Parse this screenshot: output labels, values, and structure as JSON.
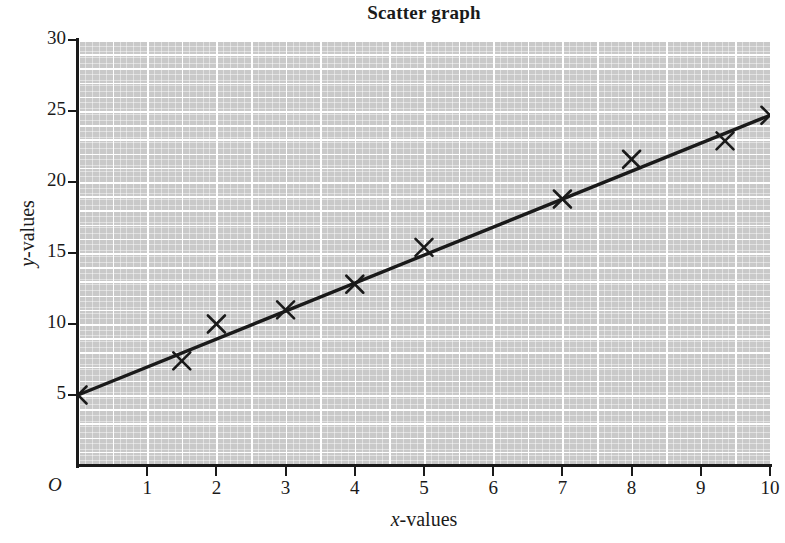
{
  "chart_data": {
    "type": "scatter",
    "title": "Scatter graph",
    "xlabel_symbol": "x",
    "xlabel_rest": "-values",
    "ylabel_symbol": "y",
    "ylabel_rest": "-values",
    "xlabel": "x-values",
    "ylabel": "y-values",
    "origin_label": "O",
    "xlim": [
      0,
      10
    ],
    "ylim": [
      0,
      30
    ],
    "x_ticks": [
      1,
      2,
      3,
      4,
      5,
      6,
      7,
      8,
      9,
      10
    ],
    "x_tick_labels": [
      "1",
      "2",
      "3",
      "4",
      "5",
      "6",
      "7",
      "8",
      "9",
      "10"
    ],
    "y_ticks": [
      5,
      10,
      15,
      20,
      25,
      30
    ],
    "y_tick_labels": [
      "5",
      "10",
      "15",
      "20",
      "25",
      "30"
    ],
    "grid": true,
    "grid_major_x_step": 0.5,
    "grid_major_y_step": 1,
    "legend": null,
    "marker": "x-cross",
    "points": [
      {
        "x": 0.0,
        "y": 5.0
      },
      {
        "x": 1.5,
        "y": 7.4
      },
      {
        "x": 2.0,
        "y": 10.0
      },
      {
        "x": 3.0,
        "y": 11.0
      },
      {
        "x": 4.0,
        "y": 12.8
      },
      {
        "x": 5.0,
        "y": 15.4
      },
      {
        "x": 7.0,
        "y": 18.8
      },
      {
        "x": 8.0,
        "y": 21.6
      },
      {
        "x": 9.35,
        "y": 22.9
      },
      {
        "x": 10.0,
        "y": 24.7
      }
    ],
    "trend_line": {
      "name": "line of best fit",
      "x_start": 0.0,
      "y_start": 5.0,
      "x_end": 10.0,
      "y_end": 24.7
    },
    "colors": {
      "plot_background": "#c9c9c9",
      "gridline": "#ffffff",
      "ink": "#1a1a1a"
    }
  }
}
